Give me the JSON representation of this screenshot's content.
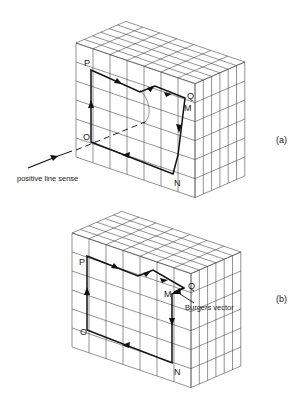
{
  "figure": {
    "panels": [
      {
        "id": "a",
        "label": "(a)",
        "description": "Burgers circuit around an edge dislocation in a distorted crystal lattice",
        "points": {
          "P": "P",
          "Q": "Q",
          "M": "M",
          "N": "N",
          "O": "O"
        },
        "annotation": "positive line sense"
      },
      {
        "id": "b",
        "label": "(b)",
        "description": "Same circuit in a perfect reference crystal; closure failure MQ",
        "points": {
          "P": "P",
          "Q": "Q",
          "M": "M",
          "N": "N",
          "O": "O"
        },
        "annotation": "Burgers vector"
      }
    ]
  },
  "colors": {
    "background": "#ffffff",
    "grid": "#4a4a4a",
    "circuit": "#111111"
  }
}
